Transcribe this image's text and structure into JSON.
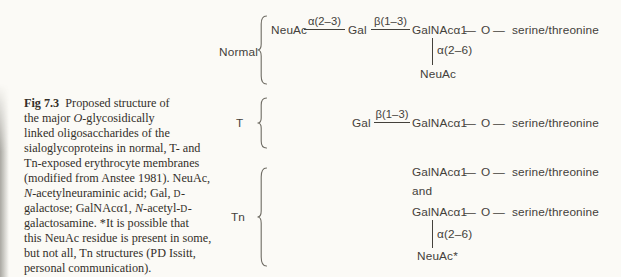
{
  "colors": {
    "paper": "#fbfaf6",
    "ink": "#44413b",
    "caption_ink": "#332f29",
    "brace": "#6f6c64"
  },
  "caption": {
    "figure_number": "Fig 7.3",
    "lines": [
      [
        {
          "t": "Fig 7.3",
          "b": 1
        },
        {
          "t": "  Proposed structure of"
        }
      ],
      [
        {
          "t": "the major "
        },
        {
          "t": "O",
          "i": 1
        },
        {
          "t": "-glycosidically"
        }
      ],
      [
        {
          "t": "linked oligosaccharides of the"
        }
      ],
      [
        {
          "t": "sialoglycoproteins in normal, T- and"
        }
      ],
      [
        {
          "t": "Tn-exposed erythrocyte membranes"
        }
      ],
      [
        {
          "t": "(modified from Anstee 1981). NeuAc,"
        }
      ],
      [
        {
          "t": "N",
          "i": 1
        },
        {
          "t": "-acetylneuraminic acid; Gal, "
        },
        {
          "t": "D",
          "sc": 1
        },
        {
          "t": "-"
        }
      ],
      [
        {
          "t": "galactose; GalNAcα1, "
        },
        {
          "t": "N",
          "i": 1
        },
        {
          "t": "-acetyl-"
        },
        {
          "t": "D",
          "sc": 1
        },
        {
          "t": "-"
        }
      ],
      [
        {
          "t": "galactosamine. *It is possible that"
        }
      ],
      [
        {
          "t": "this NeuAc residue is present in some,"
        }
      ],
      [
        {
          "t": "but not all, Tn structures (PD Issitt,"
        }
      ],
      [
        {
          "t": "personal communication)."
        }
      ]
    ]
  },
  "diagram": {
    "sections": {
      "normal": {
        "label": "Normal"
      },
      "t": {
        "label": "T"
      },
      "tn": {
        "label": "Tn",
        "and_text": "and"
      }
    },
    "residues": {
      "neuac": "NeuAc",
      "neuac_star": "NeuAc*",
      "gal": "Gal",
      "galnac": "GalNAcα1",
      "oxygen": "O",
      "ser_thr": "serine/threonine"
    },
    "bonds": {
      "a23": "α(2–3)",
      "b13": "β(1–3)",
      "a26": "α(2–6)",
      "dash": "—"
    }
  }
}
